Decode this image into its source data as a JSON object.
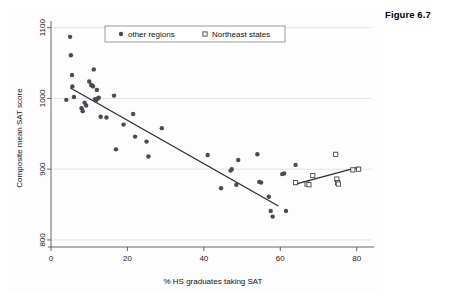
{
  "figure": {
    "caption": "Figure 6.7"
  },
  "legend": {
    "entries": [
      {
        "label": "other regions",
        "marker": "filled-circle",
        "color": "#4a4a52"
      },
      {
        "label": "Northeast states",
        "marker": "open-square",
        "color": "#3c3c44"
      }
    ]
  },
  "chart_data": {
    "type": "scatter",
    "title": "",
    "xlabel": "% HS graduates taking SAT",
    "ylabel": "Composite mean SAT score",
    "xlim": [
      0,
      84
    ],
    "ylim": [
      790,
      1108
    ],
    "xticks": [
      0,
      20,
      40,
      60,
      80
    ],
    "xtick_labels": [
      "0",
      "20",
      "40",
      "60",
      "80"
    ],
    "yticks": [
      800,
      900,
      1000,
      1100
    ],
    "ytick_labels": [
      "800",
      "900",
      "1000",
      "1100"
    ],
    "grid": "horizontal",
    "legend_position": "top-center",
    "series": [
      {
        "name": "other regions",
        "marker": "filled-circle",
        "color": "#4a4a52",
        "points": [
          [
            4.0,
            998
          ],
          [
            5.0,
            1087
          ],
          [
            5.2,
            1061
          ],
          [
            5.5,
            1033
          ],
          [
            5.6,
            1017
          ],
          [
            6.0,
            1002
          ],
          [
            8.0,
            986
          ],
          [
            8.3,
            982
          ],
          [
            8.8,
            994
          ],
          [
            9.2,
            990
          ],
          [
            10.0,
            1024
          ],
          [
            10.5,
            1019
          ],
          [
            10.8,
            1018
          ],
          [
            11.0,
            1017
          ],
          [
            11.2,
            1041
          ],
          [
            11.5,
            999
          ],
          [
            11.8,
            997
          ],
          [
            12.0,
            1012
          ],
          [
            12.2,
            1000
          ],
          [
            12.5,
            1001
          ],
          [
            13.0,
            974
          ],
          [
            14.5,
            973
          ],
          [
            16.5,
            1004
          ],
          [
            17.0,
            928
          ],
          [
            19.0,
            963
          ],
          [
            21.5,
            978
          ],
          [
            22.0,
            946
          ],
          [
            25.0,
            939
          ],
          [
            25.5,
            918
          ],
          [
            29.0,
            958
          ],
          [
            41.0,
            920
          ],
          [
            44.5,
            873
          ],
          [
            47.0,
            898
          ],
          [
            47.3,
            900
          ],
          [
            48.5,
            878
          ],
          [
            49.0,
            913
          ],
          [
            54.0,
            921
          ],
          [
            54.5,
            882
          ],
          [
            55.0,
            881
          ],
          [
            57.0,
            861
          ],
          [
            57.5,
            841
          ],
          [
            58.0,
            833
          ],
          [
            60.5,
            893
          ],
          [
            61.0,
            894
          ],
          [
            61.5,
            841
          ],
          [
            64.0,
            906
          ]
        ]
      },
      {
        "name": "Northeast states",
        "marker": "open-square",
        "color": "#3c3c44",
        "points": [
          [
            64.0,
            881
          ],
          [
            67.0,
            879
          ],
          [
            67.5,
            878
          ],
          [
            68.5,
            891
          ],
          [
            74.5,
            921
          ],
          [
            74.8,
            886
          ],
          [
            75.0,
            881
          ],
          [
            75.2,
            879
          ],
          [
            79.0,
            899
          ],
          [
            80.5,
            900
          ]
        ]
      }
    ],
    "fit_lines": [
      {
        "name": "other-regions-fit",
        "x_start": 5.0,
        "y_start": 1015,
        "x_end": 59.5,
        "y_end": 848,
        "color": "#2b2b30"
      },
      {
        "name": "northeast-states-fit",
        "x_start": 64.0,
        "y_start": 879,
        "x_end": 80.5,
        "y_end": 903,
        "color": "#2b2b30"
      }
    ]
  }
}
